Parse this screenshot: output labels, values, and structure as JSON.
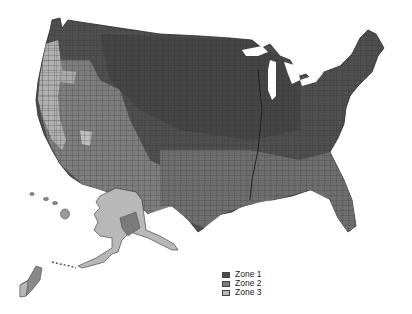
{
  "map": {
    "type": "choropleth",
    "region": "United States counties",
    "style": "grayscale",
    "insets": [
      "Alaska",
      "Hawaii",
      "Guam"
    ]
  },
  "legend": {
    "items": [
      {
        "label": "Zone 1",
        "color": "#4a4a4a"
      },
      {
        "label": "Zone 2",
        "color": "#7a7a7a"
      },
      {
        "label": "Zone 3",
        "color": "#b8b8b8"
      }
    ]
  },
  "colors": {
    "zone1": "#4a4a4a",
    "zone2": "#7a7a7a",
    "zone3": "#b8b8b8",
    "border": "#2a2a2a",
    "background": "#ffffff"
  }
}
